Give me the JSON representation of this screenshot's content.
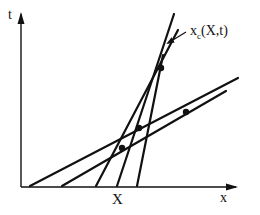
{
  "diagram": {
    "type": "characteristics-plot",
    "axes": {
      "vertical_label": "t",
      "horizontal_label": "x"
    },
    "tick_label": "X",
    "curve_label": {
      "base": "x",
      "subscript": "c",
      "args": "(X,t)"
    },
    "colors": {
      "line": "#111111",
      "background": "#ffffff"
    },
    "lines": [
      {
        "x1": 30,
        "y1": 186,
        "x2": 238,
        "y2": 78
      },
      {
        "x1": 62,
        "y1": 186,
        "x2": 226,
        "y2": 91
      },
      {
        "x1": 96,
        "y1": 186,
        "x2": 178,
        "y2": 30
      },
      {
        "x1": 117,
        "y1": 186,
        "x2": 174,
        "y2": 14
      },
      {
        "x1": 137,
        "y1": 186,
        "x2": 163,
        "y2": 55
      }
    ],
    "points": [
      {
        "cx": 122,
        "cy": 148
      },
      {
        "cx": 139,
        "cy": 128
      },
      {
        "cx": 161,
        "cy": 68
      },
      {
        "cx": 186,
        "cy": 112
      }
    ],
    "pointer_arrow": {
      "x1": 186,
      "y1": 32,
      "x2": 168,
      "y2": 43
    }
  }
}
